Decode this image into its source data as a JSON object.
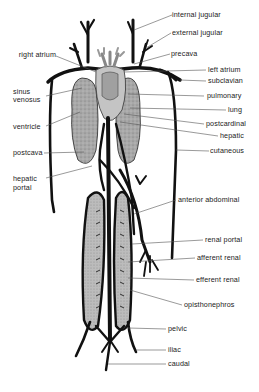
{
  "diagram": {
    "colors": {
      "vessel": "#111111",
      "organ_fill": "#9a9a9a",
      "organ_fill_light": "#bdbdbd",
      "leader_line": "#555555",
      "label_text": "#222222",
      "background": "#ffffff"
    },
    "labels_left": [
      {
        "id": "right_atrium",
        "text": "right atrium"
      },
      {
        "id": "sinus_venosus_1",
        "text": "sinus"
      },
      {
        "id": "sinus_venosus_2",
        "text": "venosus"
      },
      {
        "id": "ventricle",
        "text": "ventricle"
      },
      {
        "id": "postcava",
        "text": "postcava"
      },
      {
        "id": "hepatic_portal_1",
        "text": "hepatic"
      },
      {
        "id": "hepatic_portal_2",
        "text": "portal"
      }
    ],
    "labels_right": [
      {
        "id": "internal_jugular",
        "text": "internal jugular"
      },
      {
        "id": "external_jugular",
        "text": "external jugular"
      },
      {
        "id": "precava",
        "text": "precava"
      },
      {
        "id": "left_atrium",
        "text": "left atrium"
      },
      {
        "id": "subclavian",
        "text": "subclavian"
      },
      {
        "id": "pulmonary",
        "text": "pulmonary"
      },
      {
        "id": "lung",
        "text": "lung"
      },
      {
        "id": "postcardinal",
        "text": "postcardinal"
      },
      {
        "id": "hepatic",
        "text": "hepatic"
      },
      {
        "id": "cutaneous",
        "text": "cutaneous"
      },
      {
        "id": "anterior_abdominal",
        "text": "anterior abdominal"
      },
      {
        "id": "renal_portal",
        "text": "renal portal"
      },
      {
        "id": "afferent_renal",
        "text": "afferent renal"
      },
      {
        "id": "efferent_renal",
        "text": "efferent renal"
      },
      {
        "id": "opisthonephros",
        "text": "opisthonephros"
      },
      {
        "id": "pelvic",
        "text": "pelvic"
      },
      {
        "id": "iliac",
        "text": "iliac"
      },
      {
        "id": "caudal",
        "text": "caudal"
      }
    ]
  }
}
